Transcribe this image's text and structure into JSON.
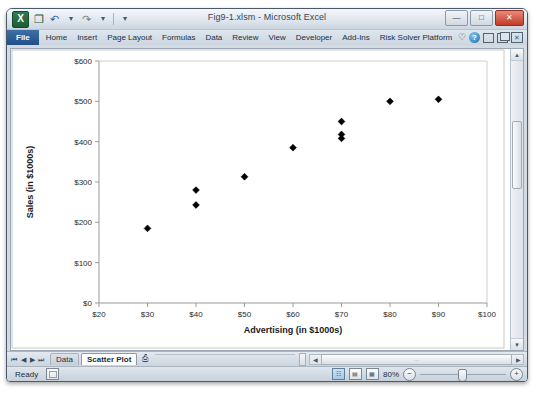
{
  "window": {
    "title": "Fig9-1.xlsm - Microsoft Excel",
    "app_icon": "excel-icon",
    "app_icon_glyph": "X",
    "quick_access": [
      {
        "name": "save-button",
        "glyph": "❐"
      },
      {
        "name": "undo-button",
        "glyph": "↶"
      },
      {
        "name": "redo-button",
        "glyph": "↷"
      },
      {
        "name": "customize-qat-button",
        "glyph": "▾"
      }
    ],
    "controls": [
      {
        "name": "minimize-button",
        "glyph": "—"
      },
      {
        "name": "restore-button",
        "glyph": "□"
      },
      {
        "name": "close-button",
        "glyph": "✕"
      }
    ]
  },
  "ribbon": {
    "tabs": [
      {
        "label": "File",
        "active": true
      },
      {
        "label": "Home",
        "active": false
      },
      {
        "label": "Insert",
        "active": false
      },
      {
        "label": "Page Layout",
        "active": false
      },
      {
        "label": "Formulas",
        "active": false
      },
      {
        "label": "Data",
        "active": false
      },
      {
        "label": "Review",
        "active": false
      },
      {
        "label": "View",
        "active": false
      },
      {
        "label": "Developer",
        "active": false
      },
      {
        "label": "Add-Ins",
        "active": false
      },
      {
        "label": "Risk Solver Platform",
        "active": false
      }
    ],
    "right_icons": [
      {
        "name": "favorite-icon",
        "glyph": "♡"
      },
      {
        "name": "help-icon",
        "glyph": "?"
      },
      {
        "name": "minimize-ribbon-icon",
        "glyph": "–"
      },
      {
        "name": "restore-window-icon",
        "glyph": "❐"
      },
      {
        "name": "close-window-icon",
        "glyph": "✕"
      }
    ]
  },
  "sheet_tabs": {
    "nav_buttons": [
      "⏮",
      "◀",
      "▶",
      "⏭"
    ],
    "tabs": [
      {
        "label": "Data",
        "active": false
      },
      {
        "label": "Scatter Plot",
        "active": true
      }
    ],
    "new_sheet_label": "➕",
    "new_sheet_icon": "new-sheet-icon"
  },
  "status_bar": {
    "status": "Ready",
    "macro_record_icon": "record-macro-icon",
    "view_buttons": [
      {
        "name": "normal-view-button",
        "glyph": "☷",
        "selected": true
      },
      {
        "name": "page-layout-view-button",
        "glyph": "▤",
        "selected": false
      },
      {
        "name": "page-break-preview-button",
        "glyph": "▦",
        "selected": false
      }
    ],
    "zoom_level": "80%",
    "zoom_out_glyph": "−",
    "zoom_in_glyph": "+"
  },
  "scrollbars": {
    "vertical_up_glyph": "▲",
    "vertical_down_glyph": "▼",
    "horizontal_left_glyph": "◀",
    "horizontal_right_glyph": "▶",
    "horizontal_thumb_grip": "…"
  },
  "chart_data": {
    "type": "scatter",
    "title": "",
    "xlabel": "Advertising (in $1000s)",
    "ylabel": "Sales (in $1000s)",
    "xlim": [
      20,
      100
    ],
    "ylim": [
      0,
      600
    ],
    "xticks": [
      20,
      30,
      40,
      50,
      60,
      70,
      80,
      90,
      100
    ],
    "xticklabels": [
      "$20",
      "$30",
      "$40",
      "$50",
      "$60",
      "$70",
      "$80",
      "$90",
      "$100"
    ],
    "yticks": [
      0,
      100,
      200,
      300,
      400,
      500,
      600
    ],
    "yticklabels": [
      "$0",
      "$100",
      "$200",
      "$300",
      "$400",
      "$500",
      "$600"
    ],
    "grid": false,
    "legend": false,
    "marker": "diamond",
    "marker_color": "#000000",
    "points": [
      {
        "x": 30,
        "y": 185
      },
      {
        "x": 40,
        "y": 280
      },
      {
        "x": 40,
        "y": 243
      },
      {
        "x": 50,
        "y": 313
      },
      {
        "x": 60,
        "y": 385
      },
      {
        "x": 70,
        "y": 450
      },
      {
        "x": 70,
        "y": 418
      },
      {
        "x": 70,
        "y": 408
      },
      {
        "x": 80,
        "y": 500
      },
      {
        "x": 90,
        "y": 505
      }
    ]
  }
}
